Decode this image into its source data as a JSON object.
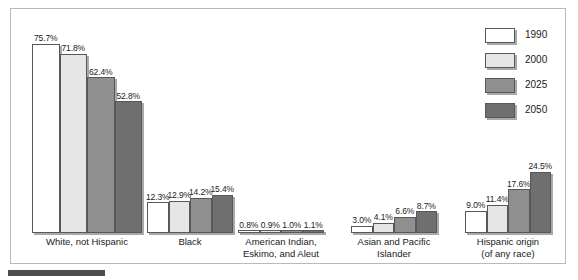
{
  "chart_data": {
    "type": "bar",
    "title": "",
    "xlabel": "",
    "ylabel": "",
    "ylim": [
      0,
      80
    ],
    "grid": false,
    "legend_position": "top-right",
    "value_suffix": "%",
    "categories": [
      "White, not Hispanic",
      "Black",
      "American Indian,\nEskimo, and Aleut",
      "Asian and Pacific\nIslander",
      "Hispanic origin\n(of any race)"
    ],
    "series": [
      {
        "name": "1990",
        "color": "#ffffff",
        "values": [
          75.7,
          12.3,
          0.8,
          3.0,
          9.0
        ],
        "labels": [
          "75.7%",
          "12.3%",
          "0.8%",
          "3.0%",
          "9.0%"
        ]
      },
      {
        "name": "2000",
        "color": "#e6e6e6",
        "values": [
          71.8,
          12.9,
          0.9,
          4.1,
          11.4
        ],
        "labels": [
          "71.8%",
          "12.9%",
          "0.9%",
          "4.1%",
          "11.4%"
        ]
      },
      {
        "name": "2025",
        "color": "#8f8f8f",
        "values": [
          62.4,
          14.2,
          1.0,
          6.6,
          17.6
        ],
        "labels": [
          "62.4%",
          "14.2%",
          "1.0%",
          "6.6%",
          "17.6%"
        ]
      },
      {
        "name": "2050",
        "color": "#6f6f6f",
        "values": [
          52.8,
          15.4,
          1.1,
          8.7,
          24.5
        ],
        "labels": [
          "52.8%",
          "15.4%",
          "1.1%",
          "8.7%",
          "24.5%"
        ]
      }
    ]
  },
  "legend": {
    "items": [
      {
        "label": "1990"
      },
      {
        "label": "2000"
      },
      {
        "label": "2025"
      },
      {
        "label": "2050"
      }
    ]
  },
  "groups": [
    {
      "caption": "White, not Hispanic"
    },
    {
      "caption": "Black"
    },
    {
      "caption": "American Indian,\nEskimo, and Aleut"
    },
    {
      "caption": "Asian and Pacific\nIslander"
    },
    {
      "caption": "Hispanic origin\n(of any race)"
    }
  ]
}
